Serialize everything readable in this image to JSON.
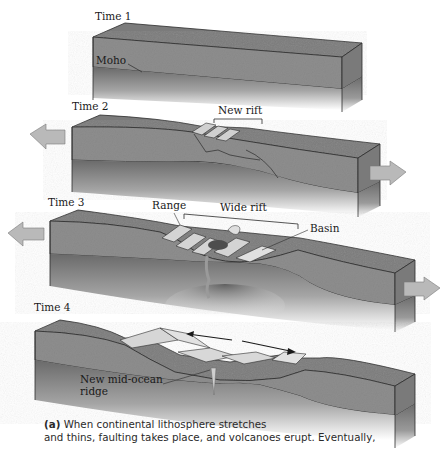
{
  "figure": {
    "panels": [
      {
        "time_label": "Time 1",
        "annotations": [
          "Moho"
        ]
      },
      {
        "time_label": "Time 2",
        "annotations": [
          "New rift"
        ]
      },
      {
        "time_label": "Time 3",
        "annotations": [
          "Range",
          "Wide rift",
          "Basin"
        ]
      },
      {
        "time_label": "Time 4",
        "annotations": [
          "New mid-ocean",
          "ridge"
        ]
      }
    ],
    "colors": {
      "crust": "#8f8f8f",
      "crust_top": "#7d7d7d",
      "mantle": "#6e6e6e",
      "arrow": "#b9b9b9",
      "rift_block": "#d2d2d2",
      "line": "#2b2b2b"
    }
  },
  "caption": {
    "label": "(a)",
    "line1": " When continental lithosphere stretches",
    "line2": "and thins, faulting takes place, and volcanoes erupt. Eventually,"
  }
}
